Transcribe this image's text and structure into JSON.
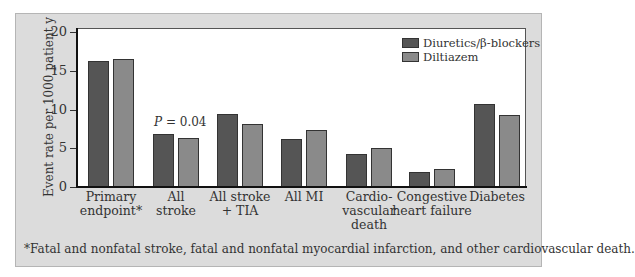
{
  "chart_data": {
    "type": "bar",
    "title": "",
    "xlabel": "",
    "ylabel": "Event rate per 1000 patient y",
    "ylim": [
      0,
      20
    ],
    "yticks": [
      0,
      5,
      10,
      15,
      20
    ],
    "grid": false,
    "legend_position": "top-right",
    "categories": [
      "Primary endpoint*",
      "All stroke",
      "All stroke + TIA",
      "All MI",
      "Cardio-vascular death",
      "Congestive heart failure",
      "Diabetes"
    ],
    "category_lines": [
      [
        "Primary",
        "endpoint*"
      ],
      [
        "All",
        "stroke"
      ],
      [
        "All stroke",
        "+ TIA"
      ],
      [
        "All MI"
      ],
      [
        "Cardio-",
        "vascular",
        "death"
      ],
      [
        "Congestive",
        "heart failure"
      ],
      [
        "Diabetes"
      ]
    ],
    "series": [
      {
        "name": "Diuretics/β-blockers",
        "color": "#555555",
        "values": [
          16.2,
          6.9,
          9.4,
          6.2,
          4.3,
          1.9,
          10.7
        ]
      },
      {
        "name": "Diltiazem",
        "color": "#8a8a8a",
        "values": [
          16.5,
          6.3,
          8.1,
          7.4,
          5.0,
          2.3,
          9.3
        ]
      }
    ],
    "annotations": [
      {
        "text": "P = 0.04",
        "category": "All stroke"
      }
    ],
    "footnote": "*Fatal and nonfatal stroke, fatal and nonfatal myocardial infarction, and other cardiovascular death."
  }
}
